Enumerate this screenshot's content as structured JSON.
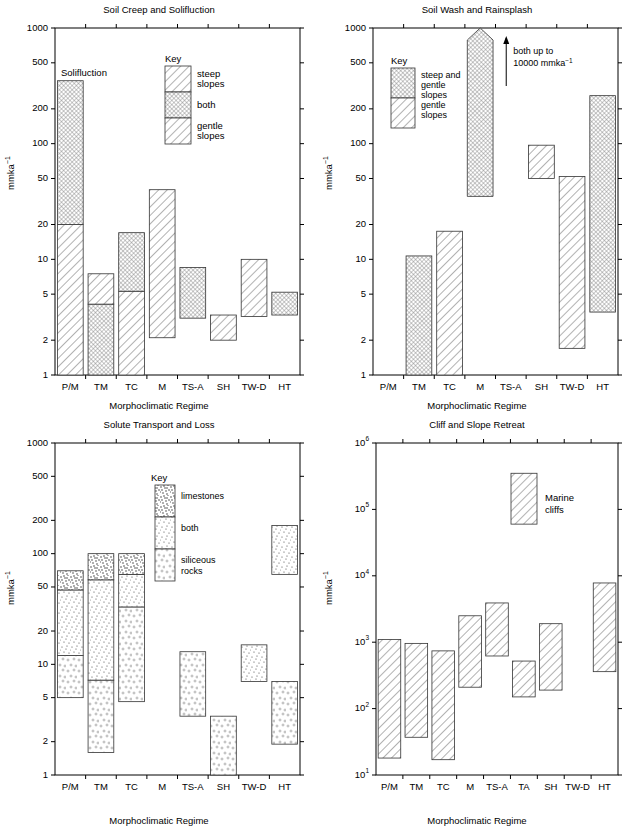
{
  "figure": {
    "y_axis_label": "mmka",
    "y_axis_label_sup": "-1",
    "x_axis_label": "Morphoclimatic Regime"
  },
  "chart_data": [
    {
      "type": "bar",
      "id": "soil-creep",
      "title": "Soil Creep and Solifluction",
      "xlabel": "Morphoclimatic Regime",
      "ylabel": "mmka-1",
      "ylim": [
        1,
        1000
      ],
      "yticks": [
        1,
        2,
        5,
        10,
        20,
        50,
        100,
        200,
        500,
        1000
      ],
      "ytick_labels": [
        "1",
        "2",
        "5",
        "10",
        "20",
        "50",
        "100",
        "200",
        "500",
        "1000"
      ],
      "log": true,
      "grid": false,
      "categories": [
        "P/M",
        "TM",
        "TC",
        "M",
        "TS-A",
        "SH",
        "TW-D",
        "HT"
      ],
      "annotation": "Solifluction",
      "legend": {
        "title": "Key",
        "entries": [
          {
            "label": "steep slopes",
            "fill": "hatch-steep"
          },
          {
            "label": "both",
            "fill": "crosshatch-both"
          },
          {
            "label": "gentle slopes",
            "fill": "hatch-gentle"
          }
        ]
      },
      "bars": [
        {
          "cat": "P/M",
          "segments": [
            {
              "low": 1,
              "high": 20,
              "fill": "hatch-gentle"
            },
            {
              "low": 20,
              "high": 350,
              "fill": "crosshatch-both"
            }
          ]
        },
        {
          "cat": "TM",
          "segments": [
            {
              "low": 1,
              "high": 4.1,
              "fill": "crosshatch-both"
            },
            {
              "low": 4.1,
              "high": 7.5,
              "fill": "hatch-gentle"
            }
          ]
        },
        {
          "cat": "TC",
          "segments": [
            {
              "low": 1,
              "high": 5.3,
              "fill": "hatch-gentle"
            },
            {
              "low": 5.3,
              "high": 17,
              "fill": "crosshatch-both"
            }
          ]
        },
        {
          "cat": "M",
          "segments": [
            {
              "low": 2.1,
              "high": 40,
              "fill": "hatch-gentle"
            }
          ]
        },
        {
          "cat": "TS-A",
          "segments": [
            {
              "low": 3.1,
              "high": 8.5,
              "fill": "crosshatch-both"
            }
          ]
        },
        {
          "cat": "SH",
          "segments": [
            {
              "low": 2.0,
              "high": 3.3,
              "fill": "hatch-gentle"
            }
          ]
        },
        {
          "cat": "TW-D",
          "segments": [
            {
              "low": 3.2,
              "high": 10,
              "fill": "hatch-gentle"
            }
          ]
        },
        {
          "cat": "HT",
          "segments": [
            {
              "low": 3.3,
              "high": 5.2,
              "fill": "crosshatch-both"
            }
          ]
        }
      ]
    },
    {
      "type": "bar",
      "id": "soil-wash",
      "title": "Soil Wash and Rainsplash",
      "xlabel": "Morphoclimatic Regime",
      "ylabel": "mmka-1",
      "ylim": [
        1,
        1000
      ],
      "yticks": [
        1,
        2,
        5,
        10,
        20,
        50,
        100,
        200,
        500,
        1000
      ],
      "ytick_labels": [
        "1",
        "2",
        "5",
        "10",
        "20",
        "50",
        "100",
        "200",
        "500",
        "1000"
      ],
      "log": true,
      "grid": false,
      "categories": [
        "P/M",
        "TM",
        "TC",
        "M",
        "TS-A",
        "SH",
        "TW-D",
        "HT"
      ],
      "annotation": "both up to 10000 mmka-1",
      "annotation_line1": "both up to",
      "annotation_line2": "10000 mmka",
      "annotation_line2_sup": "-1",
      "legend": {
        "title": "Key",
        "entries": [
          {
            "label": "steep and gentle slopes",
            "fill": "crosshatch-both"
          },
          {
            "label": "gentle slopes",
            "fill": "hatch-gentle"
          }
        ]
      },
      "bars": [
        {
          "cat": "TM",
          "segments": [
            {
              "low": 1,
              "high": 10.7,
              "fill": "crosshatch-both"
            }
          ]
        },
        {
          "cat": "TC",
          "segments": [
            {
              "low": 1,
              "high": 17.5,
              "fill": "hatch-gentle"
            }
          ]
        },
        {
          "cat": "M",
          "capped": true,
          "segments": [
            {
              "low": 35,
              "high": 1000,
              "fill": "crosshatch-both"
            }
          ]
        },
        {
          "cat": "SH",
          "segments": [
            {
              "low": 50,
              "high": 97,
              "fill": "hatch-gentle"
            }
          ]
        },
        {
          "cat": "TW-D",
          "segments": [
            {
              "low": 1.7,
              "high": 52,
              "fill": "hatch-gentle"
            }
          ]
        },
        {
          "cat": "HT",
          "segments": [
            {
              "low": 3.5,
              "high": 260,
              "fill": "crosshatch-both"
            }
          ]
        }
      ]
    },
    {
      "type": "bar",
      "id": "solute-transport",
      "title": "Solute Transport and Loss",
      "xlabel": "Morphoclimatic Regime",
      "ylabel": "mmka-1",
      "ylim": [
        1,
        1000
      ],
      "yticks": [
        1,
        2,
        5,
        10,
        20,
        50,
        100,
        200,
        500,
        1000
      ],
      "ytick_labels": [
        "1",
        "2",
        "5",
        "10",
        "20",
        "50",
        "100",
        "200",
        "500",
        "1000"
      ],
      "log": true,
      "grid": false,
      "categories": [
        "P/M",
        "TM",
        "TC",
        "M",
        "TS-A",
        "SH",
        "TW-D",
        "HT"
      ],
      "legend": {
        "title": "Key",
        "entries": [
          {
            "label": "limestones",
            "fill": "dots-limestone"
          },
          {
            "label": "both",
            "fill": "dots-both"
          },
          {
            "label": "siliceous rocks",
            "fill": "dots-siliceous"
          }
        ]
      },
      "bars": [
        {
          "cat": "P/M",
          "segments": [
            {
              "low": 5.0,
              "high": 12,
              "fill": "dots-siliceous"
            },
            {
              "low": 12,
              "high": 47,
              "fill": "dots-both"
            },
            {
              "low": 47,
              "high": 70,
              "fill": "dots-limestone"
            }
          ]
        },
        {
          "cat": "TM",
          "segments": [
            {
              "low": 1.6,
              "high": 7.2,
              "fill": "dots-siliceous"
            },
            {
              "low": 7.2,
              "high": 58,
              "fill": "dots-both"
            },
            {
              "low": 58,
              "high": 100,
              "fill": "dots-limestone"
            }
          ]
        },
        {
          "cat": "TC",
          "segments": [
            {
              "low": 4.6,
              "high": 33,
              "fill": "dots-siliceous"
            },
            {
              "low": 33,
              "high": 65,
              "fill": "dots-both"
            },
            {
              "low": 65,
              "high": 100,
              "fill": "dots-limestone"
            }
          ]
        },
        {
          "cat": "TS-A",
          "segments": [
            {
              "low": 3.4,
              "high": 13,
              "fill": "dots-siliceous"
            }
          ]
        },
        {
          "cat": "SH",
          "segments": [
            {
              "low": 1.0,
              "high": 3.4,
              "fill": "dots-siliceous"
            }
          ]
        },
        {
          "cat": "TW-D",
          "segments": [
            {
              "low": 7.0,
              "high": 15,
              "fill": "dots-both"
            }
          ]
        },
        {
          "cat": "HT",
          "segments": [
            {
              "low": 1.9,
              "high": 7.0,
              "fill": "dots-siliceous"
            },
            {
              "low": 65,
              "high": 180,
              "fill": "dots-both"
            }
          ]
        }
      ]
    },
    {
      "type": "bar",
      "id": "cliff-retreat",
      "title": "Cliff and Slope Retreat",
      "xlabel": "Morphoclimatic Regime",
      "ylabel": "mmka-1",
      "ylim": [
        10,
        1000000
      ],
      "yticks": [
        10,
        100,
        1000,
        10000,
        100000,
        1000000
      ],
      "ytick_labels": [
        "10",
        "10",
        "10",
        "10",
        "10",
        "10"
      ],
      "ytick_exponents": [
        "1",
        "2",
        "3",
        "4",
        "5",
        "6"
      ],
      "log": true,
      "grid": false,
      "categories": [
        "P/M",
        "TM",
        "TC",
        "M",
        "TS-A",
        "TA",
        "SH",
        "TW-D",
        "HT"
      ],
      "legend": {
        "title": "",
        "entries": [
          {
            "label": "Marine cliffs",
            "fill": "hatch-gentle"
          }
        ]
      },
      "legend_label_line1": "Marine",
      "legend_label_line2": "cliffs",
      "legend_swatch": {
        "low": 60000,
        "high": 350000
      },
      "bars": [
        {
          "cat": "P/M",
          "segments": [
            {
              "low": 18,
              "high": 1100,
              "fill": "hatch-gentle"
            }
          ]
        },
        {
          "cat": "TM",
          "segments": [
            {
              "low": 37,
              "high": 960,
              "fill": "hatch-gentle"
            }
          ]
        },
        {
          "cat": "TC",
          "segments": [
            {
              "low": 17,
              "high": 740,
              "fill": "hatch-gentle"
            }
          ]
        },
        {
          "cat": "M",
          "segments": [
            {
              "low": 210,
              "high": 2500,
              "fill": "hatch-gentle"
            }
          ]
        },
        {
          "cat": "TS-A",
          "segments": [
            {
              "low": 620,
              "high": 3900,
              "fill": "hatch-gentle"
            }
          ]
        },
        {
          "cat": "TA",
          "segments": [
            {
              "low": 150,
              "high": 520,
              "fill": "hatch-gentle"
            }
          ]
        },
        {
          "cat": "SH",
          "segments": [
            {
              "low": 190,
              "high": 1900,
              "fill": "hatch-gentle"
            }
          ]
        },
        {
          "cat": "HT",
          "segments": [
            {
              "low": 360,
              "high": 7800,
              "fill": "hatch-gentle"
            }
          ]
        }
      ]
    }
  ]
}
